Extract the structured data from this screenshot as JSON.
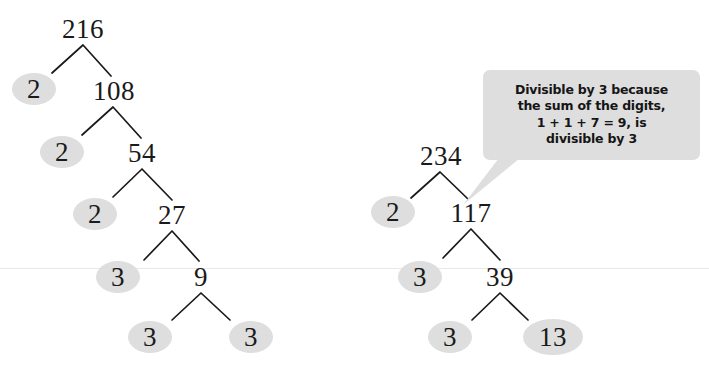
{
  "page": {
    "width": 709,
    "height": 379,
    "background": "#ffffff",
    "ink_color": "#1a1a1a",
    "leaf_fill": "#dedede",
    "callout_fill": "#dedede",
    "hairline_color": "#e8e8e8"
  },
  "hairline": {
    "x": 0,
    "y": 268,
    "width": 709
  },
  "trees": [
    {
      "name": "factor-tree-216",
      "root": "216",
      "nodes": [
        {
          "id": "n216",
          "label": "216",
          "type": "composite",
          "x": 60,
          "y": 14,
          "w": 46,
          "h": 30
        },
        {
          "id": "n2a",
          "label": "2",
          "type": "prime",
          "x": 12,
          "y": 73,
          "w": 44,
          "h": 32
        },
        {
          "id": "n108",
          "label": "108",
          "type": "composite",
          "x": 89,
          "y": 76,
          "w": 50,
          "h": 30
        },
        {
          "id": "n2b",
          "label": "2",
          "type": "prime",
          "x": 40,
          "y": 136,
          "w": 44,
          "h": 32
        },
        {
          "id": "n54",
          "label": "54",
          "type": "composite",
          "x": 122,
          "y": 138,
          "w": 40,
          "h": 30
        },
        {
          "id": "n2c",
          "label": "2",
          "type": "prime",
          "x": 73,
          "y": 198,
          "w": 44,
          "h": 32
        },
        {
          "id": "n27",
          "label": "27",
          "type": "composite",
          "x": 152,
          "y": 200,
          "w": 40,
          "h": 30
        },
        {
          "id": "n3a",
          "label": "3",
          "type": "prime",
          "x": 96,
          "y": 261,
          "w": 44,
          "h": 32
        },
        {
          "id": "n9",
          "label": "9",
          "type": "composite",
          "x": 189,
          "y": 262,
          "w": 24,
          "h": 30
        },
        {
          "id": "n3b",
          "label": "3",
          "type": "prime",
          "x": 128,
          "y": 321,
          "w": 44,
          "h": 32
        },
        {
          "id": "n3c",
          "label": "3",
          "type": "prime",
          "x": 229,
          "y": 321,
          "w": 44,
          "h": 32
        }
      ],
      "branches": [
        {
          "apex": [
            83,
            45
          ],
          "left": [
            52,
            73
          ],
          "right": [
            111,
            76
          ]
        },
        {
          "apex": [
            113,
            107
          ],
          "left": [
            82,
            135
          ],
          "right": [
            141,
            138
          ]
        },
        {
          "apex": [
            142,
            169
          ],
          "left": [
            113,
            197
          ],
          "right": [
            172,
            200
          ]
        },
        {
          "apex": [
            172,
            231
          ],
          "left": [
            144,
            260
          ],
          "right": [
            199,
            261
          ]
        },
        {
          "apex": [
            201,
            293
          ],
          "left": [
            172,
            320
          ],
          "right": [
            230,
            320
          ]
        }
      ]
    },
    {
      "name": "factor-tree-234",
      "root": "234",
      "nodes": [
        {
          "id": "m234",
          "label": "234",
          "type": "composite",
          "x": 416,
          "y": 141,
          "w": 50,
          "h": 30
        },
        {
          "id": "m2",
          "label": "2",
          "type": "prime",
          "x": 371,
          "y": 196,
          "w": 44,
          "h": 32
        },
        {
          "id": "m117",
          "label": "117",
          "type": "composite",
          "x": 446,
          "y": 198,
          "w": 50,
          "h": 30
        },
        {
          "id": "m3a",
          "label": "3",
          "type": "prime",
          "x": 398,
          "y": 261,
          "w": 44,
          "h": 32
        },
        {
          "id": "m39",
          "label": "39",
          "type": "composite",
          "x": 480,
          "y": 262,
          "w": 40,
          "h": 30
        },
        {
          "id": "m3b",
          "label": "3",
          "type": "prime",
          "x": 428,
          "y": 321,
          "w": 44,
          "h": 32
        },
        {
          "id": "m13",
          "label": "13",
          "type": "prime",
          "x": 523,
          "y": 319,
          "w": 60,
          "h": 36
        }
      ],
      "branches": [
        {
          "apex": [
            440,
            172
          ],
          "left": [
            411,
            198
          ],
          "right": [
            468,
            199
          ]
        },
        {
          "apex": [
            471,
            229
          ],
          "left": [
            443,
            258
          ],
          "right": [
            500,
            260
          ]
        },
        {
          "apex": [
            500,
            293
          ],
          "left": [
            472,
            320
          ],
          "right": [
            528,
            320
          ]
        }
      ]
    }
  ],
  "callout": {
    "name": "divisibility-callout",
    "x": 483,
    "y": 70,
    "width": 217,
    "height": 90,
    "lines": [
      "Divisible by 3 because",
      "the sum of the digits,",
      "1 + 1 + 7 = 9, is",
      "divisible by 3"
    ],
    "tail": {
      "points": "499,158 520,158 463,205"
    }
  }
}
